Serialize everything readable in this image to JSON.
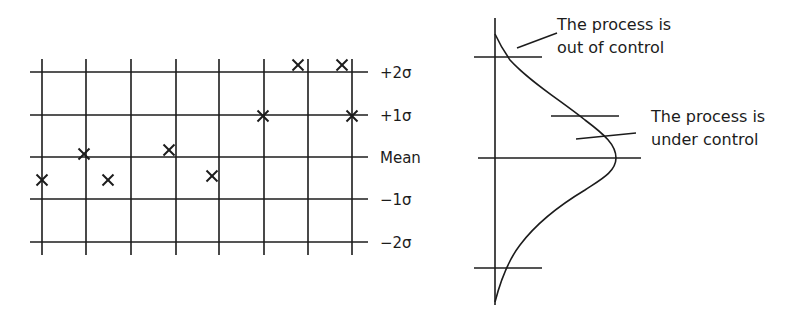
{
  "control_chart": {
    "levels": [
      {
        "label": "+2σ",
        "y": 72
      },
      {
        "label": "+1σ",
        "y": 115
      },
      {
        "label": "Mean",
        "y": 157
      },
      {
        "label": "−1σ",
        "y": 199
      },
      {
        "label": "−2σ",
        "y": 242
      }
    ],
    "columns_x": [
      42,
      86,
      131,
      176,
      219,
      264,
      308,
      352
    ],
    "points": [
      {
        "x": 42,
        "y": 180
      },
      {
        "x": 84,
        "y": 154
      },
      {
        "x": 108,
        "y": 180
      },
      {
        "x": 169,
        "y": 150
      },
      {
        "x": 212,
        "y": 176
      },
      {
        "x": 263,
        "y": 116
      },
      {
        "x": 298,
        "y": 65
      },
      {
        "x": 342,
        "y": 65
      },
      {
        "x": 352,
        "y": 116
      }
    ]
  },
  "distribution": {
    "annotation_out": {
      "line1": "The process is",
      "line2": "out of control"
    },
    "annotation_in": {
      "line1": "The process is",
      "line2": "under control"
    }
  }
}
